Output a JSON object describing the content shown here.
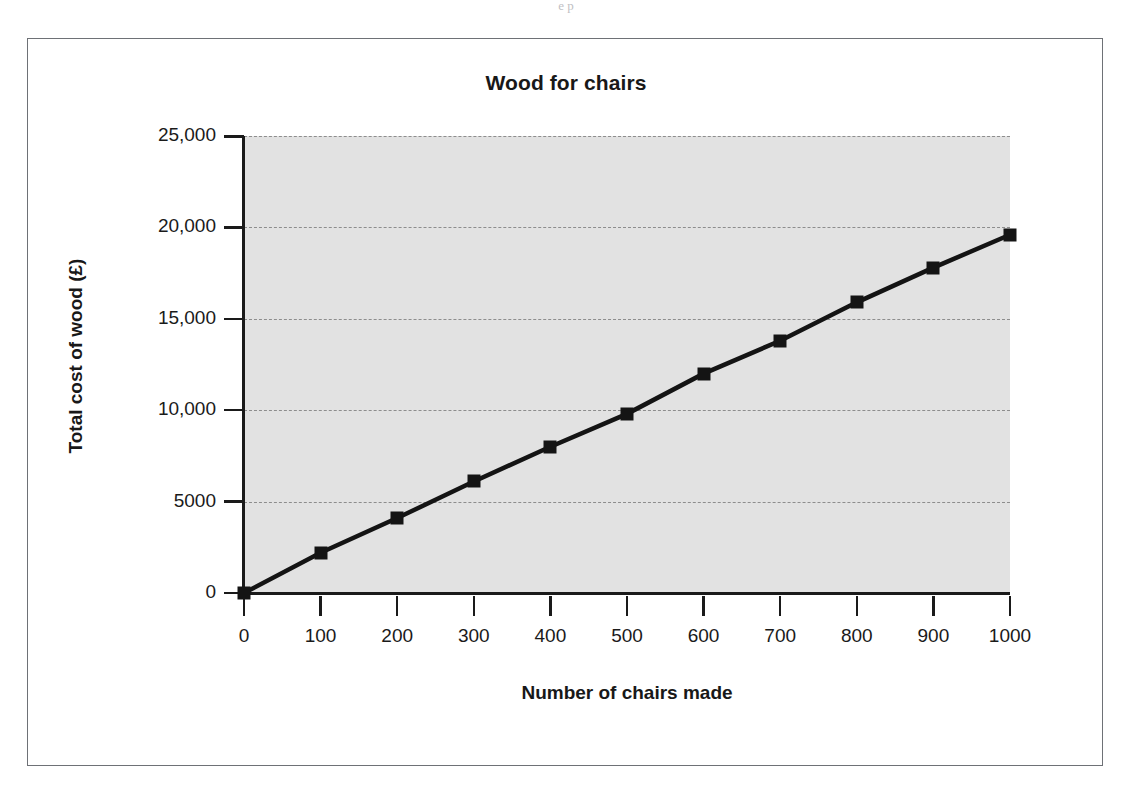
{
  "page": {
    "top_bleed_text": "e  p"
  },
  "figure": {
    "border_color": "#6e7176",
    "background": "#ffffff"
  },
  "chart_data": {
    "type": "line",
    "title": "Wood for chairs",
    "xlabel": "Number of chairs made",
    "ylabel": "Total cost of wood (£)",
    "x": [
      0,
      100,
      200,
      300,
      400,
      500,
      600,
      700,
      800,
      900,
      1000
    ],
    "values": [
      0,
      2200,
      4100,
      6100,
      8000,
      9800,
      12000,
      13800,
      15900,
      17800,
      19600
    ],
    "series": [
      {
        "name": "Total cost of wood",
        "values": [
          0,
          2200,
          4100,
          6100,
          8000,
          9800,
          12000,
          13800,
          15900,
          17800,
          19600
        ]
      }
    ],
    "xlim": [
      0,
      1000
    ],
    "ylim": [
      0,
      25000
    ],
    "x_ticks": [
      0,
      100,
      200,
      300,
      400,
      500,
      600,
      700,
      800,
      900,
      1000
    ],
    "x_tick_labels": [
      "0",
      "100",
      "200",
      "300",
      "400",
      "500",
      "600",
      "700",
      "800",
      "900",
      "1000"
    ],
    "y_ticks": [
      0,
      5000,
      10000,
      15000,
      20000,
      25000
    ],
    "y_tick_labels": [
      "0",
      "5000",
      "10,000",
      "15,000",
      "20,000",
      "25,000"
    ],
    "grid": "horizontal-dashed",
    "legend": "none",
    "marker": "filled-square",
    "line_color": "#141414",
    "marker_color": "#141414",
    "plot_background": "#e2e2e2",
    "gridline_color": "#8d8d8d",
    "slope_per_chair": 19.6,
    "annotations": []
  }
}
